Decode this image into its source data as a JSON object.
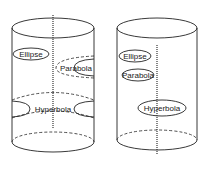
{
  "figure": {
    "panels": [
      {
        "id": "left-cylinder",
        "labels": {
          "ellipse": "Ellipse",
          "parabola": "Parabola",
          "hyperbola": "Hyperbola"
        }
      },
      {
        "id": "right-cylinder",
        "labels": {
          "ellipse": "Ellipse",
          "parabola": "Parabola",
          "hyperbola": "Hyperbola"
        }
      }
    ],
    "colors": {
      "ink": "#222222",
      "background": "#ffffff"
    }
  }
}
